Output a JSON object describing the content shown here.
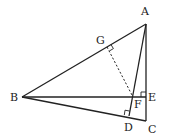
{
  "diagram": {
    "type": "geometry-triangle",
    "colors": {
      "line": "#222222",
      "background": "#ffffff"
    },
    "points": {
      "A": {
        "label": "A",
        "x": 146,
        "y": 24,
        "lx": 141,
        "ly": 15
      },
      "B": {
        "label": "B",
        "x": 22,
        "y": 97,
        "lx": 10,
        "ly": 101
      },
      "C": {
        "label": "C",
        "x": 146,
        "y": 121,
        "lx": 148,
        "ly": 133
      },
      "D": {
        "label": "D",
        "x": 129,
        "y": 116,
        "lx": 124,
        "ly": 131
      },
      "E": {
        "label": "E",
        "x": 146,
        "y": 97,
        "lx": 148,
        "ly": 101
      },
      "F": {
        "label": "F",
        "x": 133,
        "y": 97,
        "lx": 134,
        "ly": 108
      },
      "G": {
        "label": "G",
        "x": 107,
        "y": 47,
        "lx": 96,
        "ly": 44
      }
    },
    "segments": [
      {
        "from": "A",
        "to": "B",
        "style": "solid"
      },
      {
        "from": "B",
        "to": "C",
        "style": "solid"
      },
      {
        "from": "A",
        "to": "C",
        "style": "solid"
      },
      {
        "from": "B",
        "to": "E",
        "style": "solid"
      },
      {
        "from": "A",
        "to": "D",
        "style": "solid"
      },
      {
        "from": "G",
        "to": "F",
        "style": "dashed"
      }
    ],
    "right_angles": [
      "G",
      "D",
      "E"
    ]
  }
}
